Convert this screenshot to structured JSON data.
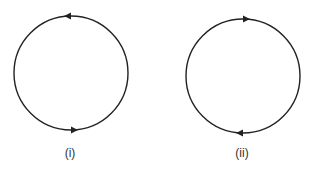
{
  "diagrams": [
    {
      "id": "i",
      "label": "(i)",
      "shape": "circle",
      "direction": "counterclockwise",
      "arrows": [
        {
          "position": "top",
          "points": "left"
        },
        {
          "position": "bottom",
          "points": "right"
        }
      ]
    },
    {
      "id": "ii",
      "label": "(ii)",
      "shape": "circle",
      "direction": "clockwise",
      "arrows": [
        {
          "position": "top",
          "points": "right"
        },
        {
          "position": "bottom",
          "points": "left"
        }
      ]
    }
  ],
  "colors": {
    "stroke": "#222222",
    "background": "#ffffff",
    "label": "#333333"
  }
}
